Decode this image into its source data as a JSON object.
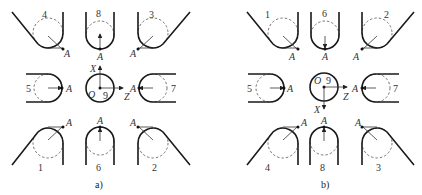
{
  "panels": [
    {
      "caption": "a)",
      "point_label": "A",
      "axes": {
        "vertical": "X",
        "horizontal": "Z",
        "origin": "O",
        "center_number": "9",
        "vertical_direction": "up"
      },
      "positions": {
        "top_left": "4",
        "top_center": "8",
        "top_right": "3",
        "mid_left": "5",
        "mid_right": "7",
        "bottom_left": "1",
        "bottom_center": "6",
        "bottom_right": "2"
      }
    },
    {
      "caption": "b)",
      "point_label": "A",
      "axes": {
        "vertical": "X",
        "horizontal": "Z",
        "origin": "O",
        "center_number": "9",
        "vertical_direction": "down"
      },
      "positions": {
        "top_left": "1",
        "top_center": "6",
        "top_right": "2",
        "mid_left": "5",
        "mid_right": "7",
        "bottom_left": "4",
        "bottom_center": "8",
        "bottom_right": "3"
      }
    }
  ]
}
